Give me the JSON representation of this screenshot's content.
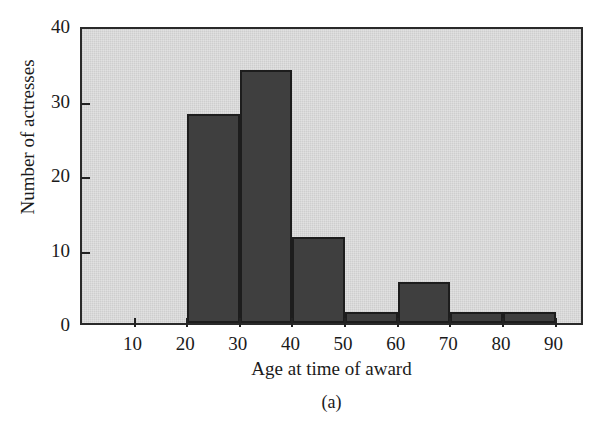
{
  "figure": {
    "panel_caption": "(a)",
    "top_cut_text": "",
    "background_color": "#ffffff",
    "plot_background_color": "#d9d9d9",
    "bar_color": "#3f3f3f",
    "axis_color": "#222222"
  },
  "chart_data": {
    "type": "bar",
    "title": "",
    "subtitle": "",
    "xlabel": "Age at time of award",
    "ylabel": "Number of actresses",
    "xlim": [
      0,
      95.6
    ],
    "ylim": [
      0,
      40
    ],
    "grid": false,
    "legend": null,
    "bin_width": 10,
    "xticks": [
      10,
      20,
      30,
      40,
      50,
      60,
      70,
      80,
      90
    ],
    "xtick_labels": [
      "10",
      "20",
      "30",
      "40",
      "50",
      "60",
      "70",
      "80",
      "90"
    ],
    "yticks": [
      0,
      10,
      20,
      30,
      40
    ],
    "ytick_labels": [
      "0",
      "10",
      "20",
      "30",
      "40"
    ],
    "categories": [
      "20-30",
      "30-40",
      "40-50",
      "50-60",
      "60-70",
      "70-80",
      "80-90"
    ],
    "bins": [
      {
        "label": "20-30",
        "start": 20,
        "end": 30,
        "value": 28
      },
      {
        "label": "30-40",
        "start": 30,
        "end": 40,
        "value": 34
      },
      {
        "label": "40-50",
        "start": 40,
        "end": 50,
        "value": 11.5
      },
      {
        "label": "50-60",
        "start": 50,
        "end": 60,
        "value": 1.5
      },
      {
        "label": "60-70",
        "start": 60,
        "end": 70,
        "value": 5.5
      },
      {
        "label": "70-80",
        "start": 70,
        "end": 80,
        "value": 1.5
      },
      {
        "label": "80-90",
        "start": 80,
        "end": 90,
        "value": 1.5
      }
    ],
    "values": [
      28,
      34,
      11.5,
      1.5,
      5.5,
      1.5,
      1.5
    ],
    "annotations": [
      "(a)"
    ]
  }
}
